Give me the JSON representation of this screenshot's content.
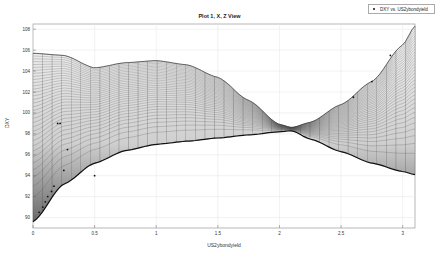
{
  "figure": {
    "title": "Plot 1, X, Z View",
    "xlabel": "US2ybondyield",
    "ylabel": "DXY",
    "legend": [
      {
        "label": "DXY vs. US2ybondyield",
        "marker": "dot",
        "color": "#111111"
      }
    ]
  },
  "chart_data": {
    "type": "scatter",
    "title": "Plot 1, X, Z View",
    "xlabel": "US2ybondyield",
    "ylabel": "DXY",
    "xlim": [
      0,
      3.1
    ],
    "ylim": [
      89,
      108.5
    ],
    "xticks": [
      0,
      0.5,
      1,
      1.5,
      2,
      2.5,
      3
    ],
    "yticks": [
      90,
      92,
      94,
      96,
      98,
      100,
      102,
      104,
      106,
      108
    ],
    "grid": true,
    "legend_position": "top-right-outside",
    "series": [
      {
        "name": "DXY vs. US2ybondyield",
        "type": "scatter",
        "x": [
          0.05,
          0.08,
          0.1,
          0.12,
          0.15,
          0.17,
          0.2,
          0.22,
          0.25,
          0.28,
          0.5,
          2.6,
          2.75,
          2.9
        ],
        "y": [
          90.5,
          91.0,
          91.5,
          92.0,
          92.5,
          93.0,
          99.0,
          99.0,
          94.5,
          96.5,
          94.0,
          101.5,
          103.0,
          105.5
        ]
      }
    ],
    "surface": {
      "description": "Fitted surface projected in X-Z view (mesh grid), gray shaded",
      "upper_envelope": {
        "x": [
          0,
          0.25,
          0.5,
          0.75,
          1.0,
          1.25,
          1.5,
          1.75,
          2.0,
          2.1,
          2.25,
          2.5,
          2.75,
          3.0,
          3.1
        ],
        "y": [
          105.7,
          105.5,
          104.3,
          104.8,
          105.0,
          104.6,
          103.4,
          101.2,
          98.9,
          98.6,
          99.1,
          100.8,
          103.0,
          106.5,
          108.3
        ]
      },
      "lower_envelope": {
        "x": [
          0,
          0.25,
          0.5,
          0.75,
          1.0,
          1.25,
          1.5,
          1.75,
          2.0,
          2.1,
          2.25,
          2.5,
          2.75,
          3.0,
          3.1
        ],
        "y": [
          89.6,
          93.2,
          95.2,
          96.4,
          97.0,
          97.3,
          97.6,
          97.9,
          98.2,
          98.3,
          97.5,
          96.3,
          95.2,
          94.4,
          94.1
        ]
      }
    }
  }
}
